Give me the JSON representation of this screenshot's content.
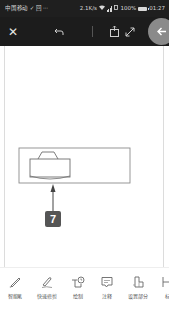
{
  "status_bar": {
    "carrier": "中国移动 ✓ 回 ···",
    "speed": "2.1K/s",
    "battery": "100%",
    "time": "01:27"
  },
  "toolbar": {
    "icons": {
      "close": "close-icon",
      "undo": "undo-icon",
      "export": "export-icon",
      "expand": "expand-icon",
      "back": "arrow-left-icon"
    }
  },
  "drawing": {
    "callout_number": "7"
  },
  "bottom_tools": [
    {
      "label": "智能笔",
      "icon": "smart-pen-icon"
    },
    {
      "label": "快速修剪",
      "icon": "quick-trim-icon"
    },
    {
      "label": "绘制",
      "icon": "draw-icon"
    },
    {
      "label": "注释",
      "icon": "annotation-icon"
    },
    {
      "label": "设置部分",
      "icon": "set-part-icon"
    },
    {
      "label": "标",
      "icon": "dimension-icon"
    }
  ],
  "colors": {
    "status_bar_bg": "#1f1f1f",
    "toolbar_bg": "#1c1c1c",
    "back_button_bg": "#8a8a8a",
    "callout_bg": "#555555"
  }
}
